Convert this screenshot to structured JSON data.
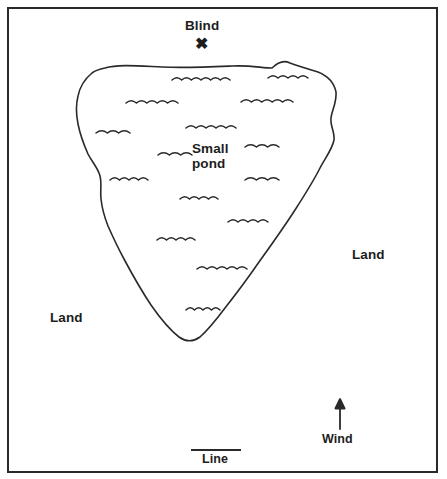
{
  "figure": {
    "type": "hunting-blind-pond-diagram",
    "background_color": "#ffffff",
    "ink_color": "#1d1d1d",
    "border": {
      "name": "figure-frame",
      "x": 8,
      "y": 8,
      "width": 429,
      "height": 464,
      "stroke_width": 2
    }
  },
  "labels": {
    "blind": "Blind",
    "blind_marker": "✖",
    "pond": "Small\npond",
    "land_right": "Land",
    "land_left": "Land",
    "wind": "Wind",
    "line": "Line"
  },
  "markers": {
    "blind_x": {
      "name": "blind-x-marker",
      "cx": 203,
      "cy": 47
    },
    "wind_arrow": {
      "name": "wind-arrow",
      "x": 340,
      "y_tail": 429,
      "y_head": 399,
      "direction": "up"
    },
    "line_segment": {
      "name": "line-scale-segment",
      "x1": 191,
      "x2": 241,
      "y": 450
    }
  },
  "pond": {
    "name": "pond-outline",
    "label": "Small pond",
    "stroke_width": 1.6,
    "fill": "none",
    "path": "M 105 68 C 118 64 140 66 162 67 C 186 68 208 67 232 66 C 250 65 262 68 272 68 C 278 62 284 60 290 63 C 298 66 308 69 318 72 C 328 76 334 82 336 92 C 337 102 332 110 331 118 C 330 126 335 132 334 140 C 332 150 325 158 320 168 C 313 182 304 196 295 210 C 284 227 272 244 259 262 C 248 278 236 294 225 308 C 216 320 208 330 200 337 C 193 342 186 342 179 337 C 170 330 160 318 151 305 C 141 290 132 274 124 259 C 117 246 112 235 108 226 C 104 216 102 208 101 199 C 100 190 102 184 100 176 C 98 168 92 162 88 154 C 84 145 80 134 78 124 C 76 114 76 104 78 96 C 80 86 86 78 92 73 C 96 70 100 69 105 68 Z"
  },
  "waves": [
    {
      "name": "wave-mark",
      "x": 172,
      "y": 80,
      "bumps": 6,
      "w": 58
    },
    {
      "name": "wave-mark",
      "x": 268,
      "y": 78,
      "bumps": 4,
      "w": 40
    },
    {
      "name": "wave-mark",
      "x": 126,
      "y": 103,
      "bumps": 5,
      "w": 52
    },
    {
      "name": "wave-mark",
      "x": 241,
      "y": 102,
      "bumps": 5,
      "w": 52
    },
    {
      "name": "wave-mark",
      "x": 96,
      "y": 133,
      "bumps": 3,
      "w": 34
    },
    {
      "name": "wave-mark",
      "x": 186,
      "y": 128,
      "bumps": 5,
      "w": 50
    },
    {
      "name": "wave-mark",
      "x": 158,
      "y": 155,
      "bumps": 3,
      "w": 34
    },
    {
      "name": "wave-mark",
      "x": 245,
      "y": 147,
      "bumps": 3,
      "w": 34
    },
    {
      "name": "wave-mark",
      "x": 110,
      "y": 180,
      "bumps": 4,
      "w": 38
    },
    {
      "name": "wave-mark",
      "x": 245,
      "y": 180,
      "bumps": 3,
      "w": 34
    },
    {
      "name": "wave-mark",
      "x": 180,
      "y": 199,
      "bumps": 4,
      "w": 38
    },
    {
      "name": "wave-mark",
      "x": 228,
      "y": 222,
      "bumps": 4,
      "w": 40
    },
    {
      "name": "wave-mark",
      "x": 157,
      "y": 240,
      "bumps": 4,
      "w": 38
    },
    {
      "name": "wave-mark",
      "x": 197,
      "y": 269,
      "bumps": 5,
      "w": 50
    },
    {
      "name": "wave-mark",
      "x": 186,
      "y": 310,
      "bumps": 4,
      "w": 34
    }
  ]
}
